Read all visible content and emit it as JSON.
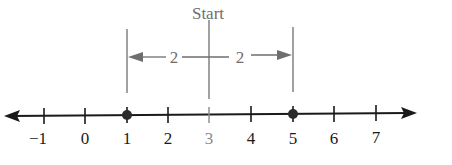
{
  "diagram": {
    "start_label": "Start",
    "start_value": 3,
    "distance_left_label": "2",
    "distance_right_label": "2",
    "highlighted_points": [
      1,
      5
    ],
    "ticks": [
      {
        "value": -1,
        "label": "−1"
      },
      {
        "value": 0,
        "label": "0"
      },
      {
        "value": 1,
        "label": "1"
      },
      {
        "value": 2,
        "label": "2"
      },
      {
        "value": 3,
        "label": "3"
      },
      {
        "value": 4,
        "label": "4"
      },
      {
        "value": 5,
        "label": "5"
      },
      {
        "value": 6,
        "label": "6"
      },
      {
        "value": 7,
        "label": "7"
      }
    ],
    "colors": {
      "axis": "#1a1a1a",
      "annotation": "#6e6e6e",
      "point": "#2a2a2a"
    }
  }
}
